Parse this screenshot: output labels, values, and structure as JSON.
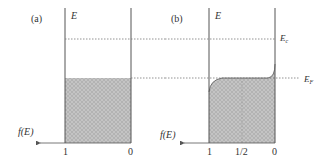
{
  "panels": [
    {
      "id": "a",
      "label": "(a)",
      "energy_axis_label": "E",
      "f_axis_label": "f(E)",
      "ticks": [
        "1",
        "0"
      ]
    },
    {
      "id": "b",
      "label": "(b)",
      "energy_axis_label": "E",
      "f_axis_label": "f(E)",
      "ticks": [
        "1",
        "1/2",
        "0"
      ],
      "levels": {
        "conduction": "Ec",
        "fermi": "EF"
      }
    }
  ],
  "colors": {
    "line": "#555555",
    "fill": "#bdbdbd",
    "dotted": "#777777"
  }
}
